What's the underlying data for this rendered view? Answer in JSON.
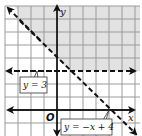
{
  "graph": {
    "axes": {
      "x_label": "x",
      "y_label": "y",
      "origin_label": "O"
    },
    "grid": {
      "x_min": -4,
      "x_max": 6,
      "y_min": -2,
      "y_max": 8,
      "step": 1
    },
    "boundary_lines": [
      {
        "id": "line-y3",
        "equation": "y = 3",
        "style": "dashed"
      },
      {
        "id": "line-diag",
        "equation": "y = −x + 4",
        "style": "dashed"
      }
    ],
    "shaded_region": {
      "description": "y > 3 and y > -x + 4",
      "color": "#e2e2e2"
    },
    "colors": {
      "grid": "#9a9a9a",
      "axis": "#111111",
      "shade": "#e2e2e2"
    }
  }
}
